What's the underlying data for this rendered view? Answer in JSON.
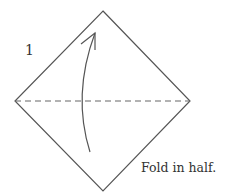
{
  "diagram": {
    "step_number": "1",
    "instruction": "Fold in half.",
    "shapes": {
      "square": "diamond-orientation",
      "fold_line": "dashed horizontal diagonal",
      "arrow": "curved upward arrow (valley fold)"
    },
    "colors": {
      "line": "#555555",
      "text": "#333333",
      "background": "#ffffff"
    }
  }
}
